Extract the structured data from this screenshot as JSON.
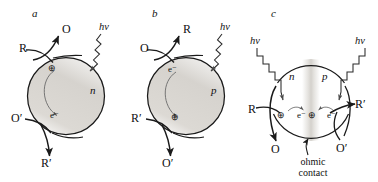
{
  "figure": {
    "type": "schematic-diagram",
    "width": 378,
    "height": 182,
    "background": "#ffffff",
    "stroke_color": "#1a1a1a",
    "shade_color": "#d7d4cf"
  },
  "panels": [
    {
      "id": "a",
      "letter": "a",
      "semiconductor_type": "n",
      "type_label": "n",
      "photon_label": "hv",
      "carriers": {
        "top": "⊕",
        "top_name": "hole",
        "bottom": "e⁻",
        "bottom_name": "electron"
      },
      "reactants": {
        "top_in": "R",
        "top_out": "O",
        "bottom_in": "O′",
        "bottom_out": "R′"
      }
    },
    {
      "id": "b",
      "letter": "b",
      "semiconductor_type": "p",
      "type_label": "p",
      "photon_label": "hv",
      "carriers": {
        "top": "e⁻",
        "top_name": "electron",
        "bottom": "⊕",
        "bottom_name": "hole"
      },
      "reactants": {
        "top_in": "O",
        "top_out": "R",
        "bottom_in": "R′",
        "bottom_out": "O′"
      }
    },
    {
      "id": "c",
      "letter": "c",
      "semiconductor_type": "n-p",
      "left_type_label": "n",
      "right_type_label": "p",
      "photon_label_left": "hv",
      "photon_label_right": "hv",
      "carriers": {
        "left_hole": "⊕",
        "left_electron": "e⁻",
        "center_hole": "⊕",
        "right_electron": "e⁻"
      },
      "reactants": {
        "left_in": "R",
        "left_out": "O",
        "right_in": "O′",
        "right_out": "R′"
      },
      "annotation_line1": "ohmic",
      "annotation_line2": "contact"
    }
  ]
}
